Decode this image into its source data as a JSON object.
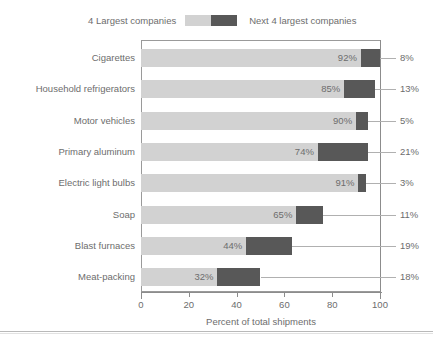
{
  "chart_data": {
    "type": "bar",
    "subtype": "stacked-horizontal",
    "title": "",
    "xlabel": "Percent of total shipments",
    "ylabel": "",
    "xlim": [
      0,
      100
    ],
    "xticks": [
      0,
      20,
      40,
      60,
      80,
      100
    ],
    "xtick_labels": [
      "0",
      "20",
      "40",
      "60",
      "80",
      "100"
    ],
    "grid": false,
    "legend_position": "top",
    "categories": [
      "Cigarettes",
      "Household refrigerators",
      "Motor vehicles",
      "Primary aluminum",
      "Electric light bulbs",
      "Soap",
      "Blast furnaces",
      "Meat-packing"
    ],
    "series": [
      {
        "name": "4 Largest companies",
        "color": "#d2d2d2",
        "values": [
          92,
          85,
          90,
          74,
          91,
          65,
          44,
          32
        ],
        "labels": [
          "92%",
          "85%",
          "90%",
          "74%",
          "91%",
          "65%",
          "44%",
          "32%"
        ]
      },
      {
        "name": "Next 4 largest companies",
        "color": "#585858",
        "values": [
          8,
          13,
          5,
          21,
          3,
          11,
          19,
          18
        ],
        "labels": [
          "8%",
          "13%",
          "5%",
          "21%",
          "3%",
          "11%",
          "19%",
          "18%"
        ]
      }
    ]
  },
  "legend": {
    "left_label": "4 Largest companies",
    "right_label": "Next 4 largest companies",
    "swatch_light_name": "legend-swatch-light",
    "swatch_dark_name": "legend-swatch-dark"
  },
  "axis": {
    "x_title": "Percent of total shipments",
    "ticks": [
      "0",
      "20",
      "40",
      "60",
      "80",
      "100"
    ]
  }
}
